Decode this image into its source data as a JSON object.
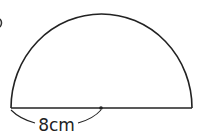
{
  "figure": {
    "shape": "semicircle",
    "radius_label": "8cm",
    "stroke_color": "#222222",
    "background": "#ffffff",
    "partial_marker": ")"
  }
}
